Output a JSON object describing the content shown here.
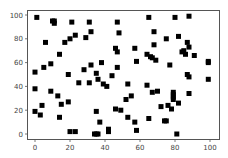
{
  "chart_data": {
    "type": "scatter",
    "title": "",
    "xlabel": "",
    "ylabel": "",
    "xlim": [
      -5,
      105
    ],
    "ylim": [
      -5,
      105
    ],
    "xticks": [
      0,
      20,
      40,
      60,
      80,
      100
    ],
    "yticks": [
      0,
      20,
      40,
      60,
      80,
      100
    ],
    "grid": false,
    "legend": null,
    "marker": "square",
    "marker_color": "#000000",
    "series": [
      {
        "name": "points",
        "x": [
          1,
          10,
          11,
          11,
          21,
          6,
          17,
          20,
          23,
          14,
          31,
          32,
          29,
          47,
          48,
          46,
          47,
          65,
          68,
          68,
          75,
          57,
          58,
          64,
          66,
          67,
          69,
          80,
          88,
          82,
          87,
          88,
          84,
          85,
          86,
          91,
          99,
          77,
          0,
          5,
          9,
          19,
          25,
          28,
          0,
          9,
          13,
          32,
          38,
          35,
          36,
          31,
          39,
          41,
          47,
          44,
          53,
          64,
          67,
          70,
          52,
          55,
          79,
          79,
          79,
          79,
          87,
          88,
          88,
          99,
          82,
          0,
          3,
          4,
          15,
          14,
          19,
          20,
          23,
          35,
          34,
          35,
          36,
          37,
          42,
          42,
          46,
          49,
          53,
          57,
          58,
          65,
          72,
          76,
          78,
          74,
          75,
          81,
          99
        ],
        "y": [
          98,
          95,
          95,
          93,
          94,
          77,
          77,
          80,
          83,
          67,
          94,
          86,
          81,
          94,
          85,
          72,
          69,
          98,
          86,
          75,
          80,
          72,
          61,
          67,
          65,
          64,
          62,
          98,
          99,
          82,
          77,
          73,
          69,
          70,
          67,
          66,
          61,
          58,
          52,
          56,
          59,
          50,
          43,
          54,
          38,
          36,
          32,
          58,
          60,
          51,
          46,
          43,
          42,
          40,
          56,
          49,
          42,
          41,
          35,
          36,
          29,
          32,
          35,
          33,
          31,
          29,
          50,
          48,
          34,
          46,
          26,
          19,
          16,
          24,
          25,
          14,
          27,
          2,
          2,
          19,
          0,
          0,
          0,
          10,
          4,
          2,
          21,
          20,
          14,
          10,
          3,
          13,
          23,
          24,
          21,
          11,
          11,
          0,
          60
        ]
      }
    ]
  },
  "axes": {
    "x_tick_labels": [
      "0",
      "20",
      "40",
      "60",
      "80",
      "100"
    ],
    "y_tick_labels": [
      "0",
      "20",
      "40",
      "60",
      "80",
      "100"
    ]
  }
}
